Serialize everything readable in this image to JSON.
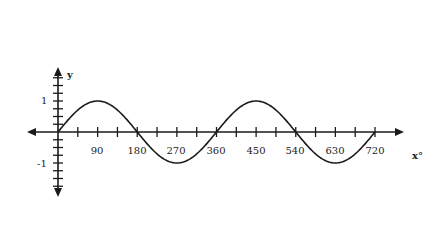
{
  "chart_data": {
    "type": "line",
    "title": "",
    "xlabel": "x°",
    "ylabel": "y",
    "function": "y = sin(x)",
    "x_ticks": [
      90,
      180,
      270,
      360,
      450,
      540,
      630,
      720
    ],
    "x_tick_labels": [
      "90",
      "180",
      "270",
      "360",
      "450",
      "540",
      "630",
      "720"
    ],
    "y_tick_labels": [
      "1",
      "-1"
    ],
    "y_tick_values": [
      1,
      -1
    ],
    "xlim": [
      0,
      720
    ],
    "ylim": [
      -1,
      1
    ],
    "grid": false,
    "series": [
      {
        "name": "sin x",
        "x": [
          0,
          45,
          90,
          135,
          180,
          225,
          270,
          315,
          360,
          405,
          450,
          495,
          540,
          585,
          630,
          675,
          720
        ],
        "values": [
          0,
          0.707,
          1,
          0.707,
          0,
          -0.707,
          -1,
          -0.707,
          0,
          0.707,
          1,
          0.707,
          0,
          -0.707,
          -1,
          -0.707,
          0
        ]
      }
    ]
  },
  "labels": {
    "y_axis": "y",
    "x_axis": "x°",
    "y_pos": "1",
    "y_neg": "-1",
    "x90": "90",
    "x180": "180",
    "x270": "270",
    "x360": "360",
    "x450": "450",
    "x540": "540",
    "x630": "630",
    "x720": "720"
  }
}
